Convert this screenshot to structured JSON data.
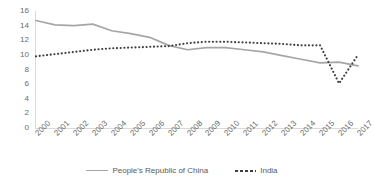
{
  "chart_data": {
    "type": "line",
    "title": "",
    "subtitle": "",
    "xlabel": "",
    "ylabel": "",
    "categories": [
      "2000",
      "2001",
      "2002",
      "2003",
      "2004",
      "2005",
      "2006",
      "2007",
      "2008",
      "2009",
      "2010",
      "2011",
      "2012",
      "2013",
      "2014",
      "2015",
      "2016",
      "2017"
    ],
    "x": [
      2000,
      2001,
      2002,
      2003,
      2004,
      2005,
      2006,
      2007,
      2008,
      2009,
      2010,
      2011,
      2012,
      2013,
      2014,
      2015,
      2016,
      2017
    ],
    "series": [
      {
        "name": "People's Republic of China",
        "style": "solid",
        "color": "#a6a6a6",
        "values": [
          14.7,
          14.1,
          14.0,
          14.2,
          13.3,
          12.9,
          12.4,
          11.3,
          10.7,
          11.0,
          11.0,
          10.7,
          10.4,
          9.9,
          9.4,
          8.9,
          9.0,
          8.5
        ]
      },
      {
        "name": "India",
        "style": "dotted",
        "color": "#3f3f3f",
        "values": [
          9.8,
          10.1,
          10.4,
          10.7,
          10.9,
          11.0,
          11.1,
          11.2,
          11.6,
          11.8,
          11.8,
          11.7,
          11.6,
          11.5,
          11.3,
          11.3,
          6.1,
          10.0
        ]
      }
    ],
    "ylim": [
      0,
      16
    ],
    "ytick_step": 2,
    "yticks": [
      "0",
      "2",
      "4",
      "6",
      "8",
      "10",
      "12",
      "14",
      "16"
    ],
    "grid": false,
    "legend_position": "bottom",
    "legend_entries": [
      "People's Republic of China",
      "India"
    ]
  },
  "legend": {
    "entries": [
      {
        "label": "People's Republic of China"
      },
      {
        "label": "India"
      }
    ]
  },
  "colors": {
    "china_line": "#a6a6a6",
    "india_line": "#3f3f3f",
    "axis": "#d9d9d9",
    "tick_text": "#6a6a6a",
    "background": "#ffffff"
  }
}
